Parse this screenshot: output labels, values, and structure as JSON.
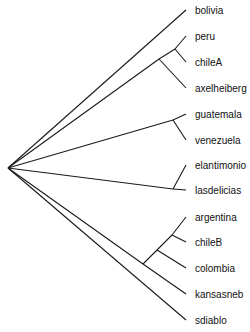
{
  "diagram": {
    "type": "phylogenetic-tree",
    "orientation": "left-to-right",
    "line_color": "#1a1a1a",
    "root": {
      "x": 8,
      "y": 168
    },
    "leaves": [
      {
        "id": "bolivia",
        "label": "bolivia",
        "x": 186,
        "y": 10
      },
      {
        "id": "peru",
        "label": "peru",
        "x": 186,
        "y": 36
      },
      {
        "id": "chileA",
        "label": "chileA",
        "x": 186,
        "y": 62
      },
      {
        "id": "axelheiberg",
        "label": "axelheiberg",
        "x": 186,
        "y": 88
      },
      {
        "id": "guatemala",
        "label": "guatemala",
        "x": 186,
        "y": 114
      },
      {
        "id": "venezuela",
        "label": "venezuela",
        "x": 186,
        "y": 140
      },
      {
        "id": "elantimonio",
        "label": "elantimonio",
        "x": 186,
        "y": 165
      },
      {
        "id": "lasdelicias",
        "label": "lasdelicias",
        "x": 186,
        "y": 190
      },
      {
        "id": "argentina",
        "label": "argentina",
        "x": 186,
        "y": 217
      },
      {
        "id": "chileB",
        "label": "chileB",
        "x": 186,
        "y": 242
      },
      {
        "id": "colombia",
        "label": "colombia",
        "x": 186,
        "y": 268
      },
      {
        "id": "kansasneb",
        "label": "kansasneb",
        "x": 186,
        "y": 294
      },
      {
        "id": "sdiablo",
        "label": "sdiablo",
        "x": 186,
        "y": 320
      }
    ],
    "internal_nodes": [
      {
        "id": "n_peru_chileA",
        "x": 175,
        "y": 49
      },
      {
        "id": "n_peru_chileA_axel",
        "x": 159,
        "y": 59
      },
      {
        "id": "n_guat_vene",
        "x": 173,
        "y": 120
      },
      {
        "id": "n_elant_lasd",
        "x": 173,
        "y": 189
      },
      {
        "id": "n_arg_chileB",
        "x": 172,
        "y": 235
      },
      {
        "id": "n_arg_chileB_col",
        "x": 157,
        "y": 250
      },
      {
        "id": "n_arg_chileB_col_kan",
        "x": 143,
        "y": 264
      }
    ],
    "edges": [
      [
        "root",
        "bolivia"
      ],
      [
        "root",
        "n_peru_chileA_axel"
      ],
      [
        "n_peru_chileA_axel",
        "n_peru_chileA"
      ],
      [
        "n_peru_chileA",
        "peru"
      ],
      [
        "n_peru_chileA",
        "chileA"
      ],
      [
        "n_peru_chileA_axel",
        "axelheiberg"
      ],
      [
        "root",
        "n_guat_vene"
      ],
      [
        "n_guat_vene",
        "guatemala"
      ],
      [
        "n_guat_vene",
        "venezuela"
      ],
      [
        "root",
        "n_elant_lasd"
      ],
      [
        "n_elant_lasd",
        "elantimonio"
      ],
      [
        "n_elant_lasd",
        "lasdelicias"
      ],
      [
        "root",
        "n_arg_chileB_col_kan"
      ],
      [
        "n_arg_chileB_col_kan",
        "n_arg_chileB_col"
      ],
      [
        "n_arg_chileB_col",
        "n_arg_chileB"
      ],
      [
        "n_arg_chileB",
        "argentina"
      ],
      [
        "n_arg_chileB",
        "chileB"
      ],
      [
        "n_arg_chileB_col",
        "colombia"
      ],
      [
        "n_arg_chileB_col_kan",
        "kansasneb"
      ],
      [
        "root",
        "sdiablo"
      ]
    ],
    "label_offset_x": 9
  }
}
